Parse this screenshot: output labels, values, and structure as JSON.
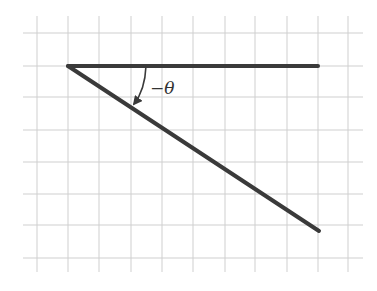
{
  "diagram": {
    "type": "angle-on-grid",
    "background": "#ffffff",
    "grid": {
      "color": "#cfcfcf",
      "vertical_x": [
        37,
        68,
        99,
        131,
        162,
        193,
        225,
        255,
        287,
        318,
        348
      ],
      "horizontal_y": [
        33,
        66,
        97,
        130,
        162,
        194,
        225,
        258
      ],
      "x_extent": [
        23,
        363
      ],
      "y_extent": [
        16,
        272
      ]
    },
    "vertex": {
      "x": 68,
      "y": 66
    },
    "rays": [
      {
        "name": "initial-side",
        "to": {
          "x": 318,
          "y": 66
        }
      },
      {
        "name": "terminal-side",
        "to": {
          "x": 319,
          "y": 231
        }
      }
    ],
    "ray_color": "#3a3a3a",
    "angle_label": "−θ",
    "angle_direction": "clockwise"
  }
}
